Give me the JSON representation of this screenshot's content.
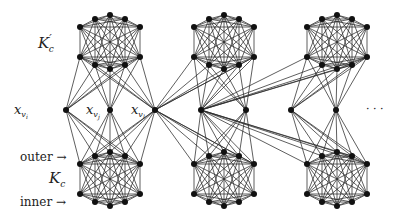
{
  "labels": {
    "top_clique": "K",
    "top_clique_prime": "′",
    "top_clique_sub": "c",
    "bottom_clique": "K",
    "bottom_clique_sub": "c",
    "outer": "outer →",
    "inner": "inner →",
    "ellipsis": "· · ·",
    "var_i_base": "x",
    "var_i_sub": "v",
    "var_i_subsub": "i",
    "var_j_base": "x",
    "var_j_sub": "v",
    "var_j_subsub": "j",
    "var_l_base": "x",
    "var_l_sub": "v",
    "var_l_subsub": "l"
  },
  "gadgets": [
    {
      "cx": 110,
      "top_y": 15,
      "bottom_y": 152
    },
    {
      "cx": 224,
      "top_y": 15,
      "bottom_y": 152
    },
    {
      "cx": 337,
      "top_y": 15,
      "bottom_y": 152
    }
  ],
  "variables": [
    {
      "id": "x_vi",
      "x": 66,
      "y": 110,
      "gadgets": [
        0
      ]
    },
    {
      "id": "x_vj",
      "x": 110,
      "y": 110,
      "gadgets": [
        0
      ]
    },
    {
      "id": "x_vl",
      "x": 155,
      "y": 110,
      "gadgets": [
        0,
        1
      ]
    },
    {
      "id": "v4",
      "x": 201,
      "y": 110,
      "gadgets": [
        1,
        2
      ]
    },
    {
      "id": "v5",
      "x": 246,
      "y": 110,
      "gadgets": [
        1
      ]
    },
    {
      "id": "v6",
      "x": 291,
      "y": 110,
      "gadgets": [
        2
      ]
    },
    {
      "id": "v7",
      "x": 336,
      "y": 110,
      "gadgets": [
        2
      ]
    }
  ]
}
